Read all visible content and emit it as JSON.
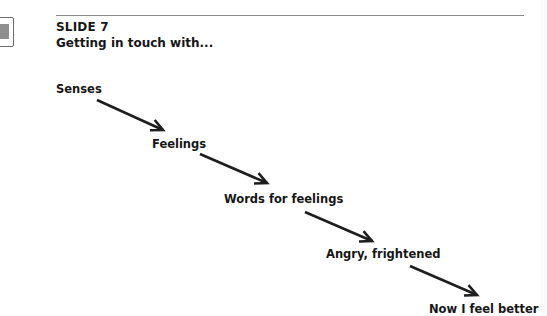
{
  "slide": {
    "number_label": "SLIDE 7",
    "title": "Getting in touch with..."
  },
  "flow": {
    "steps": [
      {
        "label": "Senses"
      },
      {
        "label": "Feelings"
      },
      {
        "label": "Words for feelings"
      },
      {
        "label": "Angry, frightened"
      },
      {
        "label": "Now I feel better"
      }
    ],
    "arrow_color": "#1e1e1e"
  }
}
